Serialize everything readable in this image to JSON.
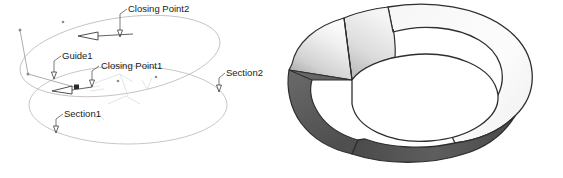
{
  "figure": {
    "background_color": "#ffffff",
    "panels": [
      {
        "id": "wireframe",
        "name": "wireframe-loft-panel",
        "description": "Wireframe loft construction with two section curves, a guide curve and two closing points",
        "line_color": "#b9b9b9",
        "annotation_color": "#1a1a1a"
      },
      {
        "id": "shaded",
        "name": "shaded-solid-panel",
        "description": "Resulting shaded lofted solid",
        "highlight_color": "#f2f2f2",
        "midtone_color": "#bfbfbf",
        "shadow_color": "#5a5a5a",
        "edge_color": "#2e2e2e"
      }
    ]
  },
  "labels": [
    {
      "id": "closing-point-2",
      "text": "Closing Point2",
      "x": 128,
      "y": 12
    },
    {
      "id": "guide-1",
      "text": "Guide1",
      "x": 62,
      "y": 59
    },
    {
      "id": "closing-point-1",
      "text": "Closing Point1",
      "x": 101,
      "y": 69
    },
    {
      "id": "section-2",
      "text": "Section2",
      "x": 226,
      "y": 76
    },
    {
      "id": "section-1",
      "text": "Section1",
      "x": 64,
      "y": 117
    }
  ],
  "colors": {
    "wire": "#b9b9b9",
    "wire_faint": "#d8d8d8",
    "leader": "#5a5a5a",
    "text": "#1a1a1a",
    "solid_edge": "#2e2e2e",
    "solid_highlight": "#f4f4f4",
    "solid_mid": "#c4c4c4",
    "solid_shadow": "#585858",
    "solid_inner": "#ffffff"
  }
}
